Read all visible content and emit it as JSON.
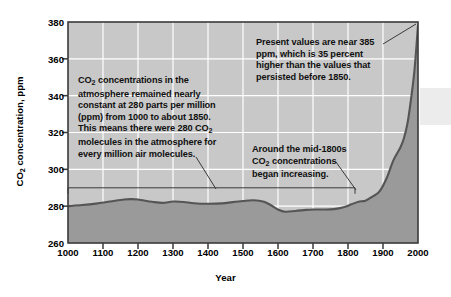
{
  "figure": {
    "title": "",
    "colors": {
      "plot_background": "#c8c8c8",
      "area_fill": "#9a9a9a",
      "curve": "#555555",
      "gridline": "#ffffff",
      "axis": "#333333",
      "text": "#111111",
      "right_band": "#ececec"
    }
  },
  "axes": {
    "y": {
      "label": "CO",
      "label_sub": "2",
      "label_tail": " concentration, ppm",
      "ticks": [
        "380",
        "360",
        "340",
        "320",
        "300",
        "280",
        "260"
      ],
      "min": 260,
      "max": 380,
      "step": 20
    },
    "x": {
      "label": "Year",
      "ticks": [
        "1000",
        "1100",
        "1200",
        "1300",
        "1400",
        "1500",
        "1600",
        "1700",
        "1800",
        "1900",
        "2000"
      ],
      "min": 1000,
      "max": 2000,
      "step": 100
    }
  },
  "annotations": [
    {
      "id": "left",
      "line1": "CO",
      "sub1": "2",
      "line1b": " concentrations in the",
      "line2": "atmosphere remained nearly",
      "line3": "constant at 280 parts per million",
      "line4": "(ppm) from 1000 to about 1850.",
      "line5": "This means there were 280 CO",
      "sub5": "2",
      "line6": "molecules in the atmosphere for",
      "line7": "every million air molecules."
    },
    {
      "id": "right-top",
      "line1": "Present values are near 385",
      "line2": "ppm, which is 35 percent",
      "line3": "higher than the values that",
      "line4": "persisted before 1850."
    },
    {
      "id": "mid",
      "line1": "Around the mid-1800s",
      "line2": "CO",
      "sub2": "2",
      "line2b": " concentrations",
      "line3": "began increasing."
    }
  ],
  "chart_data": {
    "type": "area",
    "title": "",
    "xlabel": "Year",
    "ylabel": "CO2 concentration, ppm",
    "xlim": [
      1000,
      2000
    ],
    "ylim": [
      260,
      380
    ],
    "grid": true,
    "legend": "none",
    "series": [
      {
        "name": "Atmospheric CO2 concentration",
        "x": [
          1000,
          1040,
          1080,
          1120,
          1160,
          1180,
          1200,
          1240,
          1270,
          1300,
          1330,
          1360,
          1400,
          1440,
          1470,
          1500,
          1530,
          1560,
          1580,
          1600,
          1620,
          1650,
          1680,
          1700,
          1730,
          1760,
          1790,
          1810,
          1830,
          1850,
          1870,
          1890,
          1910,
          1930,
          1950,
          1960,
          1970,
          1980,
          1990,
          2000
        ],
        "y": [
          280.0,
          280.6,
          281.4,
          282.5,
          283.6,
          283.8,
          283.6,
          282.4,
          281.8,
          282.5,
          282.3,
          281.6,
          281.3,
          281.5,
          282.2,
          282.8,
          283.2,
          282.4,
          280.5,
          278.2,
          277.0,
          277.4,
          278.0,
          278.2,
          278.2,
          278.4,
          279.6,
          281.0,
          282.4,
          283.0,
          285.2,
          288.0,
          295.0,
          305.0,
          312.0,
          317.0,
          325.0,
          338.0,
          354.0,
          378.0
        ]
      }
    ],
    "annotation_bracket": {
      "x_start": 1000,
      "x_end": 1820,
      "y": 290,
      "describes": "constant ~280 ppm period"
    },
    "notes": [
      "CO2 concentrations in the atmosphere remained nearly constant at 280 parts per million (ppm) from 1000 to about 1850. This means there were 280 CO2 molecules in the atmosphere for every million air molecules.",
      "Present values are near 385 ppm, which is 35 percent higher than the values that persisted before 1850.",
      "Around the mid-1800s CO2 concentrations began increasing."
    ]
  }
}
